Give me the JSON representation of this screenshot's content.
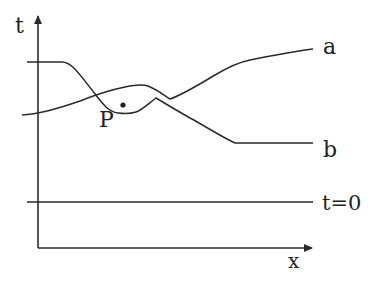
{
  "diagram": {
    "title": "",
    "axes": {
      "vertical_label": "t",
      "horizontal_label": "x"
    },
    "curves": [
      {
        "id": "a",
        "label": "a",
        "description": "rising curve starting low-left, bump near P, ending upper right"
      },
      {
        "id": "b",
        "label": "b",
        "description": "flat high at left, dips through P, ends flat lower right"
      }
    ],
    "baseline": {
      "label": "t=0"
    },
    "point": {
      "label": "P"
    },
    "colors": {
      "stroke": "#2a2a2a",
      "background": "#ffffff"
    }
  }
}
